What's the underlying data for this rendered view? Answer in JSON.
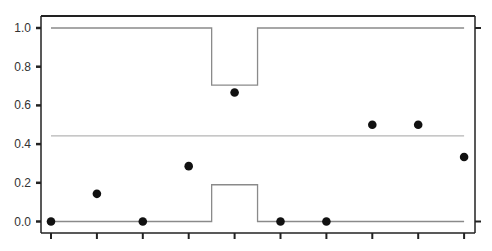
{
  "chart_data": {
    "type": "scatter",
    "title": "",
    "xlabel": "",
    "ylabel": "",
    "ylim": [
      0,
      1.0
    ],
    "grid": false,
    "legend": null,
    "y_ticks": [
      0.0,
      0.2,
      0.4,
      0.6,
      0.8,
      1.0
    ],
    "y_tick_labels": [
      "0.0",
      "0.2",
      "0.4",
      "0.6",
      "0.8",
      "1.0"
    ],
    "x": [
      1,
      2,
      3,
      4,
      5,
      6,
      7,
      8,
      9,
      10
    ],
    "x_tick_labels": [],
    "series": [
      {
        "name": "proportion",
        "kind": "points",
        "values": [
          0.0,
          0.143,
          0.0,
          0.286,
          0.667,
          0.0,
          0.0,
          0.5,
          0.5,
          0.333
        ]
      },
      {
        "name": "center_line",
        "kind": "line",
        "values": [
          0.443,
          0.443,
          0.443,
          0.443,
          0.443,
          0.443,
          0.443,
          0.443,
          0.443,
          0.443
        ]
      },
      {
        "name": "upper_control_limit",
        "kind": "step",
        "values": [
          1.0,
          1.0,
          1.0,
          1.0,
          0.705,
          1.0,
          1.0,
          1.0,
          1.0,
          1.0
        ]
      },
      {
        "name": "lower_control_limit",
        "kind": "step",
        "values": [
          0.0,
          0.0,
          0.0,
          0.0,
          0.19,
          0.0,
          0.0,
          0.0,
          0.0,
          0.0
        ]
      }
    ],
    "colors": {
      "points": "#111111",
      "center_line": "#b5b5b5",
      "limits": "#8a8a8a",
      "axis": "#222222"
    }
  }
}
